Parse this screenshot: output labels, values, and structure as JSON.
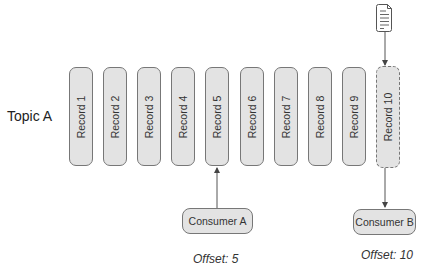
{
  "topic": {
    "label": "Topic A"
  },
  "records": [
    {
      "label": "Record 1",
      "x": 69,
      "state": "committed"
    },
    {
      "label": "Record 2",
      "x": 103,
      "state": "committed"
    },
    {
      "label": "Record 3",
      "x": 137,
      "state": "committed"
    },
    {
      "label": "Record 4",
      "x": 171,
      "state": "committed"
    },
    {
      "label": "Record 5",
      "x": 205,
      "state": "committed"
    },
    {
      "label": "Record 6",
      "x": 240,
      "state": "committed"
    },
    {
      "label": "Record 7",
      "x": 274,
      "state": "committed"
    },
    {
      "label": "Record 8",
      "x": 308,
      "state": "committed"
    },
    {
      "label": "Record 9",
      "x": 342,
      "state": "committed"
    },
    {
      "label": "Record 10",
      "x": 376,
      "state": "pending"
    }
  ],
  "consumers": [
    {
      "label": "Consumer A",
      "offset_label": "Offset: 5",
      "points_to": "Record 5"
    },
    {
      "label": "Consumer B",
      "offset_label": "Offset: 10",
      "points_to": "Record 10"
    }
  ],
  "producer": {
    "icon": "document-icon"
  },
  "colors": {
    "box_fill": "#e3e3e3",
    "box_stroke": "#777777",
    "arrow": "#444444"
  }
}
